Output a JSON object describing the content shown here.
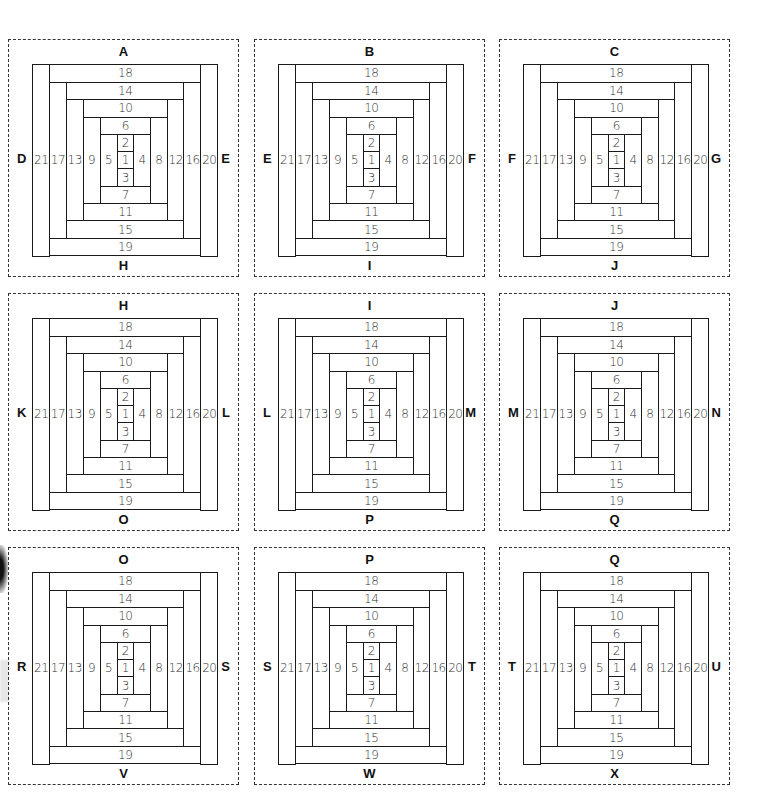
{
  "diagram": {
    "type": "log-cabin-quilt-block-grid",
    "rows": 3,
    "columns": 3,
    "piece_numbers": [
      "1",
      "2",
      "3",
      "4",
      "5",
      "6",
      "7",
      "8",
      "9",
      "10",
      "11",
      "12",
      "13",
      "14",
      "15",
      "16",
      "17",
      "18",
      "19",
      "20",
      "21"
    ],
    "blocks": [
      {
        "top": "A",
        "left": "D",
        "right": "E",
        "bottom": "H"
      },
      {
        "top": "B",
        "left": "E",
        "right": "F",
        "bottom": "I"
      },
      {
        "top": "C",
        "left": "F",
        "right": "G",
        "bottom": "J"
      },
      {
        "top": "H",
        "left": "K",
        "right": "L",
        "bottom": "O"
      },
      {
        "top": "I",
        "left": "L",
        "right": "M",
        "bottom": "P"
      },
      {
        "top": "J",
        "left": "M",
        "right": "N",
        "bottom": "Q"
      },
      {
        "top": "O",
        "left": "R",
        "right": "S",
        "bottom": "V"
      },
      {
        "top": "P",
        "left": "S",
        "right": "T",
        "bottom": "W"
      },
      {
        "top": "Q",
        "left": "T",
        "right": "U",
        "bottom": "X"
      }
    ]
  },
  "colors": {
    "line": "#1a1a1a",
    "background": "#ffffff",
    "text": "#333333"
  }
}
